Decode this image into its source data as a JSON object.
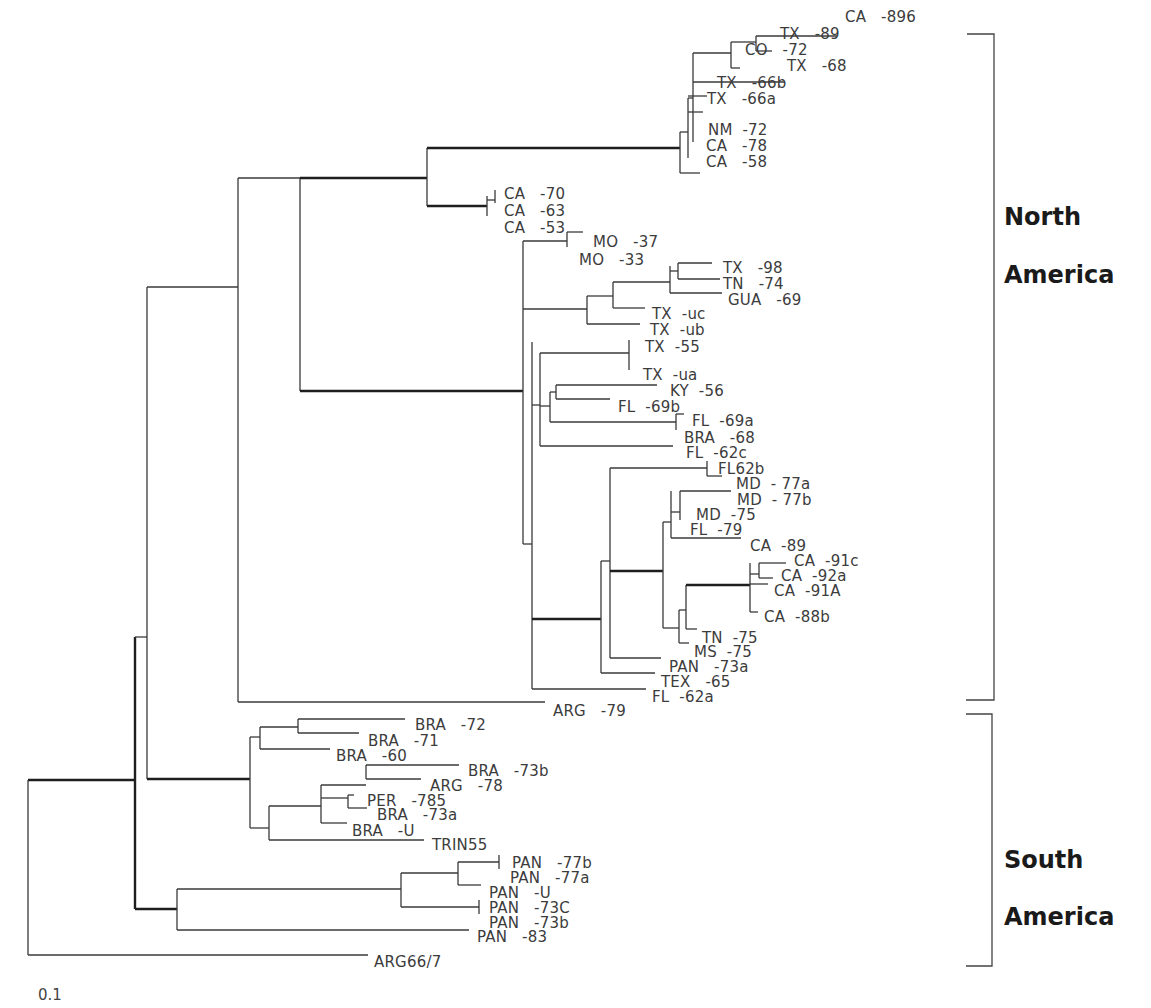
{
  "chart_data": {
    "type": "phylogenetic-tree",
    "title": "",
    "scale_bar_label": "0.1",
    "groups": [
      {
        "name": "North America",
        "line1": "North",
        "line2": "America",
        "y_top": 34,
        "y_bottom": 700,
        "label_y1": 225,
        "label_y2": 283
      },
      {
        "name": "South America",
        "line1": "South",
        "line2": "America",
        "y_top": 714,
        "y_bottom": 966,
        "label_y1": 868,
        "label_y2": 925
      }
    ],
    "leaves": [
      {
        "label": "CA   -896",
        "x": 845,
        "y": 17
      },
      {
        "label": "TX   -89",
        "x": 780,
        "y": 34
      },
      {
        "label": "CO   -72",
        "x": 745,
        "y": 50
      },
      {
        "label": "TX   -68",
        "x": 787,
        "y": 66
      },
      {
        "label": "TX   -66b",
        "x": 717,
        "y": 83
      },
      {
        "label": "TX   -66a",
        "x": 707,
        "y": 99
      },
      {
        "label": "NM  -72",
        "x": 708,
        "y": 130
      },
      {
        "label": "CA   -78",
        "x": 706,
        "y": 146
      },
      {
        "label": "CA   -58",
        "x": 706,
        "y": 162
      },
      {
        "label": "CA   -70",
        "x": 504,
        "y": 194
      },
      {
        "label": "CA   -63",
        "x": 504,
        "y": 211
      },
      {
        "label": "CA   -53",
        "x": 504,
        "y": 228
      },
      {
        "label": "MO   -37",
        "x": 593,
        "y": 242
      },
      {
        "label": "MO   -33",
        "x": 579,
        "y": 260
      },
      {
        "label": "TX   -98",
        "x": 723,
        "y": 268
      },
      {
        "label": "TN   -74",
        "x": 723,
        "y": 284
      },
      {
        "label": "GUA   -69",
        "x": 728,
        "y": 300
      },
      {
        "label": "TX  -uc",
        "x": 652,
        "y": 314
      },
      {
        "label": "TX  -ub",
        "x": 650,
        "y": 330
      },
      {
        "label": "TX  -55",
        "x": 645,
        "y": 347
      },
      {
        "label": "TX  -ua",
        "x": 643,
        "y": 375
      },
      {
        "label": "KY  -56",
        "x": 670,
        "y": 391
      },
      {
        "label": "FL  -69b",
        "x": 618,
        "y": 407
      },
      {
        "label": "FL  -69a",
        "x": 692,
        "y": 421
      },
      {
        "label": "BRA   -68",
        "x": 684,
        "y": 438
      },
      {
        "label": "FL  -62c",
        "x": 686,
        "y": 453
      },
      {
        "label": "FL62b",
        "x": 718,
        "y": 469
      },
      {
        "label": "MD  - 77a",
        "x": 736,
        "y": 484
      },
      {
        "label": "MD  - 77b",
        "x": 737,
        "y": 500
      },
      {
        "label": "MD  -75",
        "x": 696,
        "y": 515
      },
      {
        "label": "FL  -79",
        "x": 690,
        "y": 530
      },
      {
        "label": "CA  -89",
        "x": 750,
        "y": 546
      },
      {
        "label": "CA  -91c",
        "x": 794,
        "y": 561
      },
      {
        "label": "CA  -92a",
        "x": 781,
        "y": 576
      },
      {
        "label": "CA  -91A",
        "x": 774,
        "y": 591
      },
      {
        "label": "CA  -88b",
        "x": 764,
        "y": 617
      },
      {
        "label": "TN  -75",
        "x": 702,
        "y": 638
      },
      {
        "label": "MS  -75",
        "x": 694,
        "y": 652
      },
      {
        "label": "PAN   -73a",
        "x": 669,
        "y": 667
      },
      {
        "label": "TEX   -65",
        "x": 661,
        "y": 682
      },
      {
        "label": "FL  -62a",
        "x": 652,
        "y": 697
      },
      {
        "label": "ARG   -79",
        "x": 553,
        "y": 711
      },
      {
        "label": "BRA   -72",
        "x": 415,
        "y": 725
      },
      {
        "label": "BRA   -71",
        "x": 368,
        "y": 741
      },
      {
        "label": "BRA   -60",
        "x": 336,
        "y": 756
      },
      {
        "label": "BRA   -73b",
        "x": 468,
        "y": 771
      },
      {
        "label": "ARG   -78",
        "x": 430,
        "y": 786
      },
      {
        "label": "PER   -785",
        "x": 367,
        "y": 801
      },
      {
        "label": "BRA   -73a",
        "x": 377,
        "y": 815
      },
      {
        "label": "BRA   -U",
        "x": 352,
        "y": 831
      },
      {
        "label": "TRIN55",
        "x": 432,
        "y": 845
      },
      {
        "label": "PAN   -77b",
        "x": 512,
        "y": 863
      },
      {
        "label": "PAN   -77a",
        "x": 510,
        "y": 878
      },
      {
        "label": "PAN   -U",
        "x": 489,
        "y": 893
      },
      {
        "label": "PAN   -73C",
        "x": 489,
        "y": 908
      },
      {
        "label": "PAN   -73b",
        "x": 489,
        "y": 923
      },
      {
        "label": "PAN   -83",
        "x": 477,
        "y": 937
      },
      {
        "label": "ARG66/7",
        "x": 374,
        "y": 962
      }
    ],
    "branches": [
      {
        "d": "M28,780 V955",
        "w": 1
      },
      {
        "d": "M28,780 H135",
        "w": 2
      },
      {
        "d": "M28,955 H368",
        "w": 1
      },
      {
        "d": "M135,637 V909",
        "w": 2
      },
      {
        "d": "M135,637 H147",
        "w": 1
      },
      {
        "d": "M135,909 H177",
        "w": 2
      },
      {
        "d": "M147,287 V779",
        "w": 1
      },
      {
        "d": "M147,287 H238",
        "w": 1
      },
      {
        "d": "M147,779 H250",
        "w": 2
      },
      {
        "d": "M238,178 V702",
        "w": 1
      },
      {
        "d": "M238,178 H300",
        "w": 1
      },
      {
        "d": "M238,702 H545",
        "w": 1
      },
      {
        "d": "M300,178 V391",
        "w": 1
      },
      {
        "d": "M300,178 H427",
        "w": 2
      },
      {
        "d": "M300,391 H523",
        "w": 2
      },
      {
        "d": "M427,148 V206",
        "w": 1
      },
      {
        "d": "M427,148 H680",
        "w": 2
      },
      {
        "d": "M427,206 H487",
        "w": 2
      },
      {
        "d": "M487,196 V216",
        "w": 1
      },
      {
        "d": "M487,200 H495",
        "w": 1
      },
      {
        "d": "M495,190 V203",
        "w": 1
      },
      {
        "d": "M680,132 V173",
        "w": 1
      },
      {
        "d": "M680,132 H688",
        "w": 1
      },
      {
        "d": "M680,173 H700",
        "w": 1
      },
      {
        "d": "M688,98 V158",
        "w": 1
      },
      {
        "d": "M688,98 H693",
        "w": 1
      },
      {
        "d": "M693,53 V142",
        "w": 1
      },
      {
        "d": "M693,53 H731",
        "w": 1
      },
      {
        "d": "M693,82 H785",
        "w": 1
      },
      {
        "d": "M688,96 H707",
        "w": 1
      },
      {
        "d": "M688,112 H703",
        "w": 1
      },
      {
        "d": "M731,42 V68",
        "w": 1
      },
      {
        "d": "M731,42 H756",
        "w": 1
      },
      {
        "d": "M731,68 H740",
        "w": 1
      },
      {
        "d": "M756,36 V51",
        "w": 1
      },
      {
        "d": "M756,36 H837",
        "w": 1
      },
      {
        "d": "M756,51 H772",
        "w": 1
      },
      {
        "d": "M523,241 V544",
        "w": 1
      },
      {
        "d": "M523,241 H567",
        "w": 1
      },
      {
        "d": "M523,309 H587",
        "w": 1
      },
      {
        "d": "M523,544 H532",
        "w": 1
      },
      {
        "d": "M567,232 V247",
        "w": 1
      },
      {
        "d": "M567,232 H583",
        "w": 1
      },
      {
        "d": "M587,296 V324",
        "w": 1
      },
      {
        "d": "M587,296 H613",
        "w": 1
      },
      {
        "d": "M587,324 H640",
        "w": 1
      },
      {
        "d": "M613,282 V308",
        "w": 1
      },
      {
        "d": "M613,282 H670",
        "w": 1
      },
      {
        "d": "M613,308 H645",
        "w": 1
      },
      {
        "d": "M670,266 V293",
        "w": 1
      },
      {
        "d": "M670,293 H722",
        "w": 1
      },
      {
        "d": "M678,263 V279",
        "w": 1
      },
      {
        "d": "M678,263 H712",
        "w": 1
      },
      {
        "d": "M678,279 H720",
        "w": 1
      },
      {
        "d": "M670,271 H678",
        "w": 1
      },
      {
        "d": "M532,342 V689",
        "w": 1
      },
      {
        "d": "M540,353 V446",
        "w": 1
      },
      {
        "d": "M532,405 H540",
        "w": 1
      },
      {
        "d": "M540,353 H629",
        "w": 1
      },
      {
        "d": "M629,340 V370",
        "w": 1
      },
      {
        "d": "M540,446 H673",
        "w": 1
      },
      {
        "d": "M540,406 H550",
        "w": 1
      },
      {
        "d": "M550,392 V422",
        "w": 1
      },
      {
        "d": "M550,392 H556",
        "w": 1
      },
      {
        "d": "M556,385 V399",
        "w": 1
      },
      {
        "d": "M556,385 H657",
        "w": 1
      },
      {
        "d": "M556,399 H610",
        "w": 1
      },
      {
        "d": "M550,422 H676",
        "w": 1
      },
      {
        "d": "M676,414 V430",
        "w": 1
      },
      {
        "d": "M676,414 H684",
        "w": 1
      },
      {
        "d": "M532,619 H601",
        "w": 2
      },
      {
        "d": "M532,689 H646",
        "w": 1
      },
      {
        "d": "M601,561 V673",
        "w": 1
      },
      {
        "d": "M601,673 H655",
        "w": 1
      },
      {
        "d": "M601,561 H610",
        "w": 1
      },
      {
        "d": "M610,468 V658",
        "w": 1
      },
      {
        "d": "M610,468 H707",
        "w": 1
      },
      {
        "d": "M610,658 H661",
        "w": 1
      },
      {
        "d": "M610,571 H663",
        "w": 2
      },
      {
        "d": "M707,461 V476",
        "w": 1
      },
      {
        "d": "M707,476 H722",
        "w": 1
      },
      {
        "d": "M663,522 V628",
        "w": 1
      },
      {
        "d": "M663,522 H671",
        "w": 1
      },
      {
        "d": "M671,491 V538",
        "w": 1
      },
      {
        "d": "M671,538 H741",
        "w": 1
      },
      {
        "d": "M671,512 H680",
        "w": 1
      },
      {
        "d": "M680,491 V520",
        "w": 1
      },
      {
        "d": "M680,491 H731",
        "w": 1
      },
      {
        "d": "M663,628 H679",
        "w": 1
      },
      {
        "d": "M679,610 V643",
        "w": 1
      },
      {
        "d": "M679,643 H689",
        "w": 1
      },
      {
        "d": "M679,610 H686",
        "w": 1
      },
      {
        "d": "M686,585 V629",
        "w": 1
      },
      {
        "d": "M686,585 H750",
        "w": 2
      },
      {
        "d": "M686,629 H697",
        "w": 1
      },
      {
        "d": "M750,563 V612",
        "w": 1
      },
      {
        "d": "M750,612 H758",
        "w": 1
      },
      {
        "d": "M750,584 H768",
        "w": 1
      },
      {
        "d": "M750,574 H759",
        "w": 1
      },
      {
        "d": "M759,563 V578",
        "w": 1
      },
      {
        "d": "M759,563 H786",
        "w": 1
      },
      {
        "d": "M759,578 H773",
        "w": 1
      },
      {
        "d": "M250,737 V828",
        "w": 1
      },
      {
        "d": "M250,737 H260",
        "w": 1
      },
      {
        "d": "M250,828 H269",
        "w": 1
      },
      {
        "d": "M260,727 V749",
        "w": 1
      },
      {
        "d": "M260,749 H330",
        "w": 1
      },
      {
        "d": "M260,727 H298",
        "w": 1
      },
      {
        "d": "M298,719 V733",
        "w": 1
      },
      {
        "d": "M298,719 H405",
        "w": 1
      },
      {
        "d": "M298,733 H359",
        "w": 1
      },
      {
        "d": "M269,806 V840",
        "w": 1
      },
      {
        "d": "M269,840 H424",
        "w": 1
      },
      {
        "d": "M269,806 H321",
        "w": 1
      },
      {
        "d": "M321,785 V823",
        "w": 1
      },
      {
        "d": "M321,823 H347",
        "w": 1
      },
      {
        "d": "M321,785 H366",
        "w": 1
      },
      {
        "d": "M366,765 V779",
        "w": 1
      },
      {
        "d": "M366,765 H459",
        "w": 1
      },
      {
        "d": "M366,779 H421",
        "w": 1
      },
      {
        "d": "M321,798 H348",
        "w": 1
      },
      {
        "d": "M348,795 V808",
        "w": 1
      },
      {
        "d": "M348,795 H354",
        "w": 1
      },
      {
        "d": "M348,808 H367",
        "w": 1
      },
      {
        "d": "M177,889 V930",
        "w": 1
      },
      {
        "d": "M177,889 H401",
        "w": 1
      },
      {
        "d": "M177,930 H469",
        "w": 1
      },
      {
        "d": "M401,873 V907",
        "w": 1
      },
      {
        "d": "M401,873 H458",
        "w": 1
      },
      {
        "d": "M401,907 H479",
        "w": 1
      },
      {
        "d": "M458,862 V885",
        "w": 1
      },
      {
        "d": "M458,862 H499",
        "w": 1
      },
      {
        "d": "M458,885 H481",
        "w": 1
      },
      {
        "d": "M499,855 V869",
        "w": 1
      },
      {
        "d": "M479,900 V914",
        "w": 1
      }
    ]
  }
}
